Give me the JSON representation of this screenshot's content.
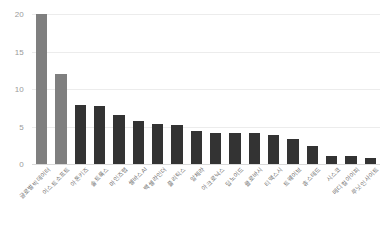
{
  "chart_data": {
    "type": "bar",
    "title": "",
    "xlabel": "",
    "ylabel": "",
    "ylim": [
      0,
      20
    ],
    "yticks": [
      0,
      5,
      10,
      15,
      20
    ],
    "ytick_labels": [
      "0",
      "5",
      "10",
      "15",
      "20"
    ],
    "grid": true,
    "legend": "none",
    "orientation": "vertical",
    "xtick_rotation": -45,
    "categories": [
      "글로벌빅데이터",
      "이스트소프트",
      "아톤키즈",
      "솔트룩스",
      "마인즈랩",
      "셀바스AI",
      "백셀라인더",
      "플리틱스",
      "알체라",
      "아크로닉스",
      "딥노이드",
      "클로바시",
      "티맥스시",
      "트웨이브",
      "휴스테드",
      "시스코",
      "메디컬아이피",
      "루닛인사이트"
    ],
    "values": [
      20,
      12,
      7.9,
      7.8,
      6.5,
      5.7,
      5.3,
      5.2,
      4.4,
      4.2,
      4.1,
      4.1,
      3.9,
      3.3,
      2.4,
      1.1,
      1.1,
      0.8
    ],
    "bar_colors": [
      "#7f7f7f",
      "#7f7f7f",
      "#333333",
      "#333333",
      "#333333",
      "#333333",
      "#333333",
      "#333333",
      "#333333",
      "#333333",
      "#333333",
      "#333333",
      "#333333",
      "#333333",
      "#333333",
      "#333333",
      "#333333",
      "#333333"
    ],
    "colors": {
      "highlight_bar": "#7f7f7f",
      "default_bar": "#333333",
      "gridline": "#ececec",
      "baseline": "#d9d9d9",
      "tick_text": "#9a9a9a",
      "label_text": "#6f6f6f",
      "background": "#ffffff"
    }
  }
}
